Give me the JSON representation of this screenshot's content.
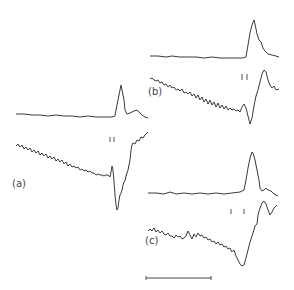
{
  "figure": {
    "panels": [
      {
        "id": "a",
        "label": "(a)",
        "upper_trace": "absorption-peak",
        "lower_trace": "derivative",
        "ticks": 2
      },
      {
        "id": "b",
        "label": "(b)",
        "upper_trace": "absorption-peak",
        "lower_trace": "derivative",
        "ticks": 2
      },
      {
        "id": "c",
        "label": "(c)",
        "upper_trace": "absorption-peak",
        "lower_trace": "derivative",
        "ticks": 2
      }
    ],
    "scale_bar": {
      "present": true,
      "label": ""
    },
    "colors": {
      "trace": "#3a3a3a",
      "background": "#ffffff"
    }
  }
}
